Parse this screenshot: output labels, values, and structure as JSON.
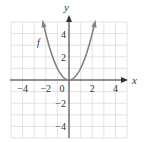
{
  "chart_data": {
    "type": "line",
    "title": "",
    "xlabel": "x",
    "ylabel": "y",
    "function_label": "f",
    "function": "x^2",
    "xlim": [
      -5,
      5
    ],
    "ylim": [
      -5,
      5.3
    ],
    "x_ticks": [
      -4,
      -2,
      0,
      2,
      4
    ],
    "y_ticks": [
      -4,
      -2,
      2,
      4
    ],
    "x_tick_labels": [
      "−4",
      "−2",
      "0",
      "2",
      "4"
    ],
    "y_tick_labels": [
      "−4",
      "−2",
      "2",
      "4"
    ],
    "grid": true,
    "series": [
      {
        "name": "f",
        "x": [
          -2.2,
          -2,
          -1.5,
          -1,
          -0.5,
          0,
          0.5,
          1,
          1.5,
          2,
          2.2
        ],
        "y": [
          4.84,
          4,
          2.25,
          1,
          0.25,
          0,
          0.25,
          1,
          2.25,
          4,
          4.84
        ]
      }
    ],
    "colors": {
      "curve": "#8c7e80",
      "axes": "#333333",
      "grid": "#dcdcdc"
    }
  }
}
